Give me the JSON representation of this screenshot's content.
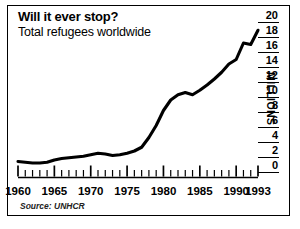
{
  "chart_data": {
    "type": "line",
    "title": "Will it ever stop?",
    "subtitle": "Total refugees worldwide",
    "source": "Source: UNHCR",
    "xlabel": "",
    "ylabel": "MILLIONS",
    "xlim": [
      1960,
      1993
    ],
    "ylim": [
      0,
      20
    ],
    "grid": false,
    "legend": null,
    "y_ticks": [
      20,
      18,
      16,
      14,
      12,
      10,
      8,
      6,
      4,
      2,
      0
    ],
    "x_ticks_major": [
      1960,
      1965,
      1970,
      1975,
      1980,
      1985,
      1990,
      1993
    ],
    "x_ticks_minor_step": 1,
    "line_color": "#000000",
    "x": [
      1960,
      1961,
      1962,
      1963,
      1964,
      1965,
      1966,
      1967,
      1968,
      1969,
      1970,
      1971,
      1972,
      1973,
      1974,
      1975,
      1976,
      1977,
      1978,
      1979,
      1980,
      1981,
      1982,
      1983,
      1984,
      1985,
      1986,
      1987,
      1988,
      1989,
      1990,
      1991,
      1992,
      1993
    ],
    "values": [
      1.4,
      1.3,
      1.2,
      1.2,
      1.3,
      1.6,
      1.8,
      1.9,
      2.0,
      2.1,
      2.3,
      2.5,
      2.4,
      2.2,
      2.3,
      2.5,
      2.8,
      3.3,
      4.6,
      6.2,
      8.2,
      9.6,
      10.3,
      10.6,
      10.3,
      10.9,
      11.6,
      12.4,
      13.3,
      14.4,
      15.0,
      17.2,
      17.0,
      18.9
    ],
    "annotations": []
  }
}
